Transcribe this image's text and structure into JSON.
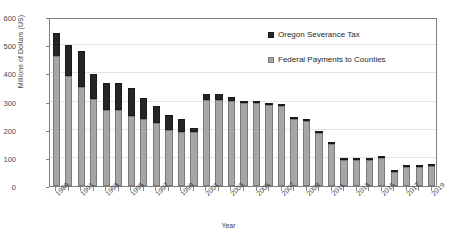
{
  "chart_data": {
    "type": "bar",
    "stacked": true,
    "title": "",
    "xlabel": "Year",
    "ylabel": "Millions of Dollars (US)",
    "ylim": [
      0,
      600
    ],
    "ytick_values": [
      0,
      100,
      200,
      300,
      400,
      500,
      600
    ],
    "ytick_labels": [
      "0",
      "100",
      "200",
      "300",
      "400",
      "500",
      "600"
    ],
    "grid": true,
    "legend_position": "upper-right-inside",
    "categories": [
      "1989",
      "1990",
      "1991",
      "1992",
      "1993",
      "1994",
      "1995",
      "1996",
      "1997",
      "1998",
      "1999",
      "2000",
      "2001",
      "2002",
      "2003",
      "2004",
      "2005",
      "2006",
      "2007",
      "2008",
      "2009",
      "2010",
      "2011",
      "2012",
      "2013",
      "2014",
      "2015",
      "2016",
      "2017",
      "2018",
      "2019"
    ],
    "xtick_labels": [
      "1989",
      "1991",
      "1993",
      "1995",
      "1997",
      "1999",
      "2001",
      "2003",
      "2005",
      "2007",
      "2009",
      "2011",
      "2013",
      "2015",
      "2017",
      "2019"
    ],
    "series": [
      {
        "name": "Federal Payments to Counties",
        "color": "#a6a6a6",
        "values": [
          460,
          390,
          350,
          310,
          270,
          270,
          250,
          237,
          222,
          200,
          192,
          190,
          305,
          305,
          302,
          296,
          296,
          288,
          283,
          238,
          230,
          187,
          148,
          92,
          94,
          92,
          98,
          50,
          68,
          68,
          70
        ]
      },
      {
        "name": "Oregon Severance Tax",
        "color": "#262626",
        "values": [
          85,
          112,
          128,
          87,
          97,
          95,
          97,
          76,
          63,
          53,
          46,
          15,
          22,
          20,
          15,
          3,
          3,
          2,
          2,
          2,
          2,
          2,
          1,
          1,
          1,
          1,
          4,
          1,
          2,
          2,
          2
        ]
      }
    ],
    "totals": [
      545,
      502,
      478,
      397,
      367,
      365,
      347,
      313,
      285,
      253,
      238,
      205,
      327,
      325,
      317,
      299,
      299,
      290,
      285,
      240,
      232,
      189,
      149,
      93,
      95,
      93,
      102,
      51,
      70,
      70,
      72
    ]
  },
  "legend": {
    "items": [
      {
        "label": "Oregon Severance Tax",
        "swatch": "black"
      },
      {
        "label": "Federal Payments to Counties",
        "swatch": "gray"
      }
    ]
  }
}
